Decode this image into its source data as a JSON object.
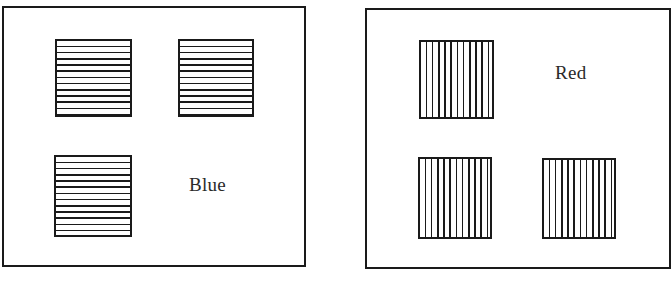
{
  "figure": {
    "panels": [
      {
        "id": "left",
        "label": "Blue",
        "stripe_orientation": "horizontal",
        "square_count": 3
      },
      {
        "id": "right",
        "label": "Red",
        "stripe_orientation": "vertical",
        "square_count": 3
      }
    ],
    "colors": {
      "line": "#1a1a1a",
      "background": "#ffffff"
    }
  }
}
